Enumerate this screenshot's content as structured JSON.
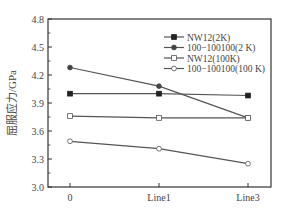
{
  "chart_data": {
    "type": "line",
    "title": "",
    "xlabel": "",
    "ylabel": "屈服应力/GPa",
    "categories": [
      "0",
      "Line1",
      "Line3"
    ],
    "ylim": [
      3.0,
      4.8
    ],
    "yticks": [
      3.0,
      3.3,
      3.6,
      3.9,
      4.2,
      4.5,
      4.8
    ],
    "ytick_labels": [
      "3.0",
      "3.3",
      "3.6",
      "3.9",
      "4.2",
      "4.5",
      "4.8"
    ],
    "grid": false,
    "legend_position": "upper right",
    "series": [
      {
        "name": "NW12(2K)",
        "marker": "filled-square",
        "values": [
          4.0,
          4.0,
          3.98
        ]
      },
      {
        "name": "100−100100(2 K)",
        "marker": "filled-circle",
        "values": [
          4.28,
          4.08,
          3.74
        ]
      },
      {
        "name": "NW12(100K)",
        "marker": "open-square",
        "values": [
          3.76,
          3.74,
          3.74
        ]
      },
      {
        "name": "100−100100(100 K)",
        "marker": "open-circle",
        "values": [
          3.49,
          3.41,
          3.25
        ]
      }
    ]
  },
  "colors": {
    "axis": "#333333",
    "line": "#555555",
    "text": "#444444"
  }
}
